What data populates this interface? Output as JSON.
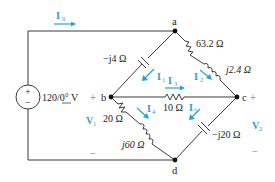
{
  "diagram": {
    "type": "ac-circuit",
    "nodes": {
      "a": "a",
      "b": "b",
      "c": "c",
      "d": "d"
    },
    "source": {
      "label": "120/0° V",
      "magnitude": "120",
      "angle": "0°",
      "unit": "V",
      "plus": "+",
      "minus": "−"
    },
    "components": {
      "cap_ab": "−j4 Ω",
      "res_ac": "63.2 Ω",
      "ind_ac": "j2.4 Ω",
      "res_bc": "10 Ω",
      "res_bd": "20 Ω",
      "ind_bd": "j60 Ω",
      "cap_cd": "−j20 Ω"
    },
    "currents": {
      "I0": {
        "main": "I",
        "sub": "0"
      },
      "I1": {
        "main": "I",
        "sub": "1"
      },
      "I2": {
        "main": "I",
        "sub": "2"
      },
      "I3": {
        "main": "I",
        "sub": "3"
      },
      "I4": {
        "main": "I",
        "sub": "4"
      },
      "I5": {
        "main": "I",
        "sub": "5"
      }
    },
    "voltages": {
      "V1": {
        "main": "V",
        "sub": "1",
        "plus": "+",
        "minus": "−"
      },
      "V2": {
        "main": "V",
        "sub": "2",
        "plus": "+",
        "minus": "−"
      }
    },
    "colors": {
      "wire": "#3a3a3a",
      "annotation": "#2aa0d8"
    }
  }
}
